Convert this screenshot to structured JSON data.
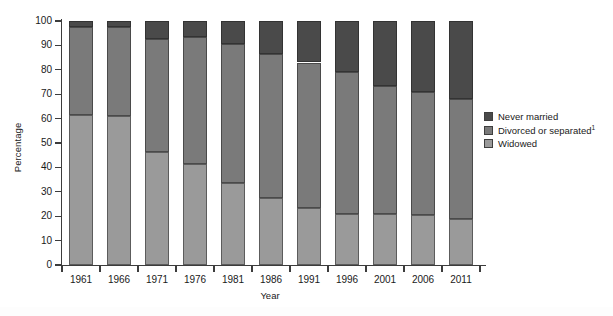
{
  "chart_data": {
    "type": "bar",
    "subtype": "stacked-bar-100",
    "title": "",
    "xlabel": "Year",
    "ylabel": "Percentage",
    "ylim": [
      0,
      100
    ],
    "ytick_step": 10,
    "yticks": [
      0,
      10,
      20,
      30,
      40,
      50,
      60,
      70,
      80,
      90,
      100
    ],
    "grid": false,
    "legend_position": "right",
    "categories": [
      "1961",
      "1966",
      "1971",
      "1976",
      "1981",
      "1986",
      "1991",
      "1996",
      "2001",
      "2006",
      "2011"
    ],
    "series": [
      {
        "name": "Widowed",
        "color": "#9a9a9a",
        "values": [
          61.5,
          61.0,
          46.5,
          41.5,
          33.5,
          27.5,
          23.5,
          21.0,
          21.0,
          20.5,
          19.0
        ]
      },
      {
        "name": "Divorced or separated",
        "footnote": "1",
        "color": "#7a7a7a",
        "values": [
          36.0,
          36.5,
          46.0,
          52.0,
          57.0,
          59.0,
          59.5,
          58.0,
          52.5,
          50.5,
          49.0
        ]
      },
      {
        "name": "Never married",
        "color": "#4a4a4a",
        "values": [
          2.5,
          2.5,
          7.5,
          6.5,
          9.5,
          13.5,
          17.0,
          21.0,
          26.5,
          29.0,
          32.0
        ]
      }
    ],
    "cumulative_tops": {
      "widowed": [
        61.5,
        61.0,
        46.5,
        41.5,
        33.5,
        27.5,
        23.5,
        21.0,
        21.0,
        20.5,
        19.0
      ],
      "divorced": [
        97.5,
        97.5,
        92.5,
        93.5,
        90.5,
        86.5,
        83.0,
        79.0,
        73.5,
        71.0,
        68.0
      ],
      "never": [
        100,
        100,
        100,
        100,
        100,
        100,
        100,
        100,
        100,
        100,
        100
      ]
    }
  },
  "legend": {
    "items": [
      {
        "label": "Never married",
        "sup": "",
        "color": "#4a4a4a"
      },
      {
        "label": "Divorced or separated",
        "sup": "1",
        "color": "#7a7a7a"
      },
      {
        "label": "Widowed",
        "sup": "",
        "color": "#9a9a9a"
      }
    ]
  },
  "axes": {
    "y_title": "Percentage",
    "x_title": "Year"
  }
}
